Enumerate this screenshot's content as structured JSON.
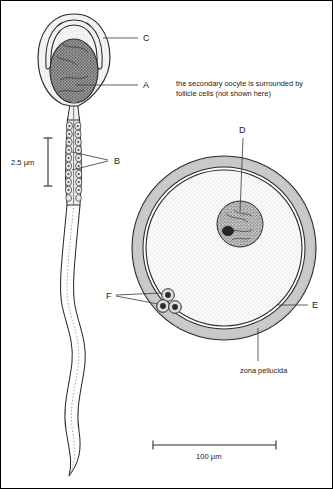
{
  "figure": {
    "border_color": "#000000",
    "background": "#ffffff"
  },
  "annotation": {
    "line1": "the secondary oocyte is surrounded by",
    "line2": "follicle cells (not shown here)"
  },
  "labels": {
    "a": "A",
    "b": "B",
    "c": "C",
    "d": "D",
    "e": "E",
    "f": "F",
    "zona_pellucida": "zona pellucida"
  },
  "scales": {
    "sperm": "2.5 µm",
    "oocyte": "100 µm"
  },
  "colors": {
    "zona_fill": "#c9c9c9",
    "cytoplasm_fill": "#f4f4f4",
    "nucleus_fill": "#8a8a8a",
    "outline": "#2b2b2b",
    "text": "#1a1a1a",
    "leader": "#3a3a3a"
  },
  "structures": {
    "sperm_acrosome": "acrosome-cap",
    "sperm_nucleus": "sperm-nucleus",
    "sperm_midpiece": "midpiece-mitochondria",
    "sperm_tail": "flagellum-tail",
    "oocyte_nucleus": "oocyte-nucleus",
    "oocyte_membrane": "oocyte-plasma-membrane",
    "polar_bodies": "polar-bodies",
    "zona": "zona-pellucida-ring"
  }
}
